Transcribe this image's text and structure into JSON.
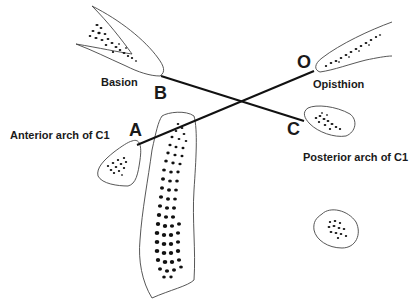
{
  "diagram": {
    "type": "anatomical-line-diagram",
    "points": {
      "B": {
        "letter": "B",
        "name": "Basion"
      },
      "O": {
        "letter": "O",
        "name": "Opisthion"
      },
      "A": {
        "letter": "A",
        "name": "Anterior arch of C1"
      },
      "C": {
        "letter": "C",
        "name": "Posterior arch of C1"
      }
    },
    "lines": [
      {
        "from": "B",
        "to": "C"
      },
      {
        "from": "A",
        "to": "O"
      }
    ],
    "colors": {
      "line": "#111111",
      "outline": "#333333",
      "background": "#ffffff"
    }
  }
}
